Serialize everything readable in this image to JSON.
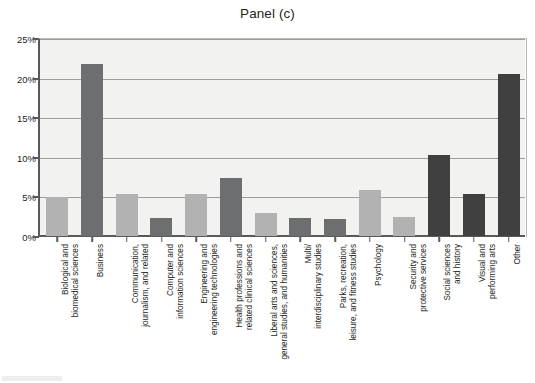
{
  "chart_data": {
    "type": "bar",
    "title": "Panel (c)",
    "xlabel": "",
    "ylabel": "",
    "ylim": [
      0,
      25
    ],
    "ytick_labels": [
      "25%",
      "20%",
      "15%",
      "10%",
      "5%",
      "0%"
    ],
    "ytick_values": [
      25,
      20,
      15,
      10,
      5,
      0
    ],
    "grid": true,
    "legend": "none",
    "categories": [
      "Biological and\nbiomedical sciences",
      "Business",
      "Communication,\njournalism, and related",
      "Computer and\ninformation sciences",
      "Engineering and\nengineering technologies",
      "Health professions and\nrelated clinical sciences",
      "Liberal arts and sciences,\ngeneral studies, and humanities",
      "Multi/\ninterdisciplinary studies",
      "Parks, recreation,\nleisure, and fitness studies",
      "Psychology",
      "Security and\nprotective services",
      "Social sciences\nand history",
      "Visual and\nperforming arts",
      "Other"
    ],
    "values": [
      5.0,
      21.8,
      5.3,
      2.3,
      5.3,
      7.3,
      2.9,
      2.3,
      2.2,
      5.8,
      2.4,
      10.3,
      5.3,
      20.6
    ],
    "bar_shades": [
      "light",
      "dark",
      "light",
      "dark",
      "light",
      "dark",
      "light",
      "dark",
      "dark",
      "light",
      "light",
      "darker",
      "darker",
      "darker"
    ],
    "colors": {
      "bar_light": "#b1b2b1",
      "bar_dark": "#6d6e70",
      "bar_darker": "#404041",
      "plot_background": "#f2f2f0",
      "gridline": "#9d9d9b",
      "axis": "#58595b",
      "text": "#231f20"
    }
  }
}
